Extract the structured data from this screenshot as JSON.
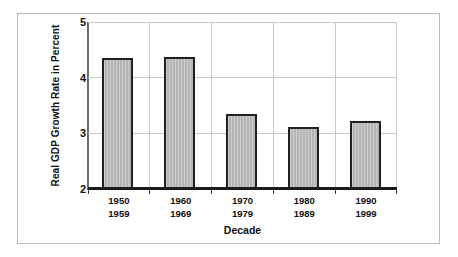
{
  "chart_data": {
    "type": "bar",
    "title": "",
    "subtitle": "",
    "xlabel": "Decade",
    "ylabel": "Real GDP Growth Rate in Percent",
    "categories": [
      "1950\n1959",
      "1960\n1969",
      "1970\n1979",
      "1980\n1989",
      "1990\n1999"
    ],
    "category_lines": [
      {
        "start": "1950",
        "end": "1959"
      },
      {
        "start": "1960",
        "end": "1969"
      },
      {
        "start": "1970",
        "end": "1979"
      },
      {
        "start": "1980",
        "end": "1989"
      },
      {
        "start": "1990",
        "end": "1999"
      }
    ],
    "values": [
      4.36,
      4.38,
      3.34,
      3.11,
      3.22
    ],
    "series": [
      {
        "name": "Real GDP Growth Rate",
        "values": [
          4.36,
          4.38,
          3.34,
          3.11,
          3.22
        ]
      }
    ],
    "ylim": [
      2,
      5
    ],
    "yticks": [
      2,
      3,
      4,
      5
    ],
    "ytick_labels": [
      "2",
      "3",
      "4",
      "5"
    ],
    "grid": "horizontal",
    "legend": "none",
    "bar_fill_color": "#b9b9b9",
    "bar_border_color": "#202020",
    "gridline_color": "#c9c9c9",
    "axis_color": "#1a1a1a",
    "background_color": "#ffffff",
    "frame_color": "#b9b9b9"
  }
}
